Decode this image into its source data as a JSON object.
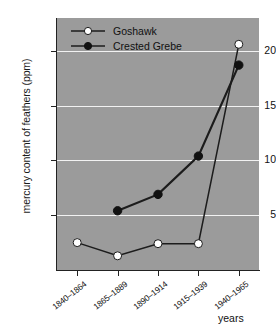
{
  "chart_data": {
    "type": "line",
    "title": "",
    "subtitle": "",
    "xlabel": "years",
    "ylabel": "mercury content of feathers (ppm)",
    "categories": [
      "1840–1864",
      "1865–1889",
      "1890–1914",
      "1915–1939",
      "1940–1965"
    ],
    "ylim": [
      0,
      23
    ],
    "yticks": [
      5,
      10,
      15,
      20
    ],
    "ytick_labels": [
      "5",
      "10",
      "15",
      "20"
    ],
    "grid": "horizontal",
    "legend_position": "top-left-inside",
    "plot_background": "#9b9b9b",
    "gridline_color": "#f2f2f2",
    "line_color": "#1c1c1c",
    "series": [
      {
        "name": "Goshawk",
        "marker": "open-circle",
        "marker_fill": "#ffffff",
        "values": [
          2.5,
          1.3,
          2.4,
          2.4,
          20.6
        ]
      },
      {
        "name": "Crested Grebe",
        "marker": "filled-circle",
        "marker_fill": "#111111",
        "values": [
          null,
          5.4,
          6.9,
          10.4,
          18.7
        ]
      }
    ]
  },
  "legend": {
    "items": [
      {
        "label": "Goshawk"
      },
      {
        "label": "Crested Grebe"
      }
    ]
  },
  "axes": {
    "y_title": "mercury content of feathers (ppm)",
    "x_title": "years"
  }
}
